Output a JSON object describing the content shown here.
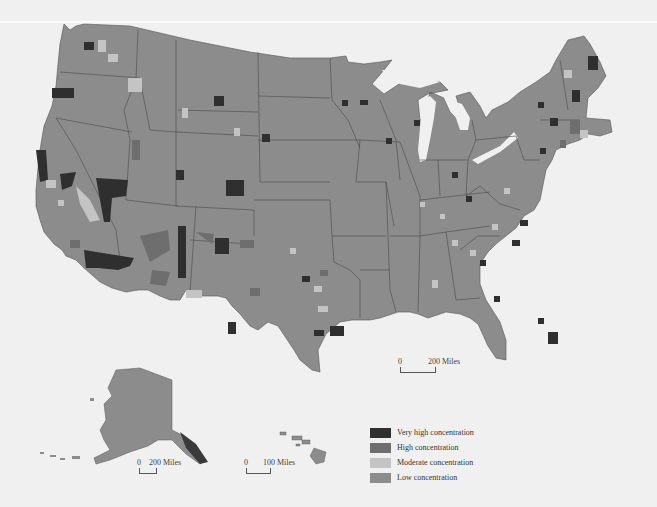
{
  "map": {
    "title": "",
    "subject": "County concentration map of the United States",
    "colors": {
      "background": "#f0f0f0",
      "very_high": "#2f2f2f",
      "high": "#6e6e6e",
      "moderate": "#c4c4c4",
      "low": "#8c8c8c",
      "state_border": "#4a4a4a"
    }
  },
  "legend": {
    "items": [
      {
        "label": "Very high concentration",
        "color": "#2f2f2f"
      },
      {
        "label": "High concentration",
        "color": "#6e6e6e"
      },
      {
        "label": "Moderate concentration",
        "color": "#c4c4c4"
      },
      {
        "label": "Low concentration",
        "color": "#8c8c8c"
      }
    ]
  },
  "scale_bars": {
    "conus": {
      "start": "0",
      "end": "200 Miles"
    },
    "alaska": {
      "start": "0",
      "end": "200 Miles"
    },
    "hawaii": {
      "start": "0",
      "end": "100 Miles"
    }
  }
}
